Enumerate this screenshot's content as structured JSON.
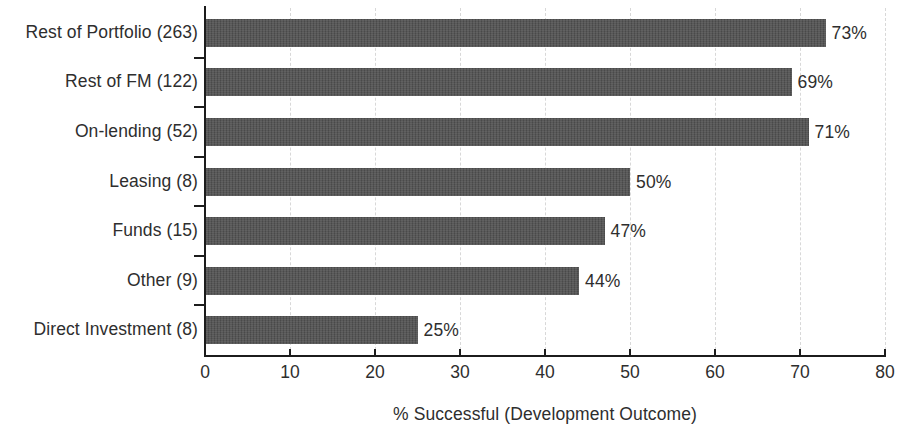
{
  "chart_data": {
    "type": "bar",
    "orientation": "horizontal",
    "title": "",
    "xlabel": "% Successful (Development Outcome)",
    "ylabel": "",
    "xlim": [
      0,
      80
    ],
    "xticks": [
      0,
      10,
      20,
      30,
      40,
      50,
      60,
      70,
      80
    ],
    "xtick_labels": [
      "0",
      "10",
      "20",
      "30",
      "40",
      "50",
      "60",
      "70",
      "80"
    ],
    "grid": true,
    "grid_axis": "x",
    "legend": false,
    "bar_color": "#4f4f4f",
    "value_suffix": "%",
    "categories": [
      "Rest of Portfolio (263)",
      "Rest of FM (122)",
      "On-lending (52)",
      "Leasing (8)",
      "Funds (15)",
      "Other (9)",
      "Direct Investment (8)"
    ],
    "values": [
      73,
      69,
      71,
      50,
      47,
      44,
      25
    ],
    "value_labels": [
      "73%",
      "69%",
      "71%",
      "50%",
      "47%",
      "44%",
      "25%"
    ],
    "counts": [
      263,
      122,
      52,
      8,
      15,
      9,
      8
    ]
  }
}
